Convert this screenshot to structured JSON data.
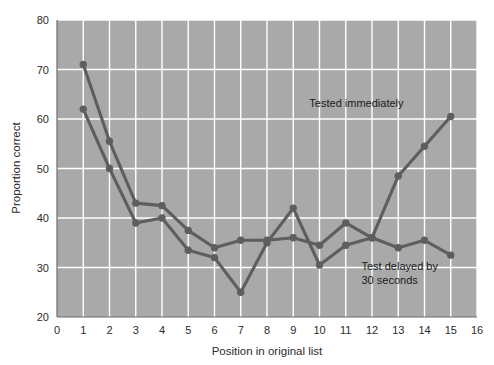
{
  "chart_data": {
    "type": "line",
    "title": "",
    "xlabel": "Position in original list",
    "ylabel": "Proportion correct",
    "xlim": [
      0,
      16
    ],
    "ylim": [
      20,
      80
    ],
    "xticks": [
      0,
      1,
      2,
      3,
      4,
      5,
      6,
      7,
      8,
      9,
      10,
      11,
      12,
      13,
      14,
      15,
      16
    ],
    "yticks": [
      20,
      30,
      40,
      50,
      60,
      70,
      80
    ],
    "grid": true,
    "legend_position": "inline-annotation",
    "x": [
      1,
      2,
      3,
      4,
      5,
      6,
      7,
      8,
      9,
      10,
      11,
      12,
      13,
      14,
      15
    ],
    "series": [
      {
        "name": "Tested immediately",
        "color": "#5e5e5e",
        "values": [
          71,
          55.5,
          43,
          42.5,
          37.5,
          34,
          35.5,
          35.5,
          36,
          34.5,
          39,
          36,
          48.5,
          54.5,
          60.5
        ],
        "annotation": "Tested immediately",
        "annotation_x": 13.2,
        "annotation_y": 62.5
      },
      {
        "name": "Test delayed by 30 seconds",
        "color": "#5e5e5e",
        "values": [
          62,
          50,
          39,
          40,
          33.5,
          32,
          25,
          35,
          42,
          30.5,
          34.5,
          36,
          34,
          35.5,
          32.5
        ],
        "annotation": "Test delayed by\n30 seconds",
        "annotation_line1": "Test delayed by",
        "annotation_line2": "30 seconds",
        "annotation_x": 11.6,
        "annotation_y": 29.5
      }
    ]
  },
  "labels": {
    "x_axis_title": "Position in original list",
    "y_axis_title": "Proportion correct",
    "series_1_annotation": "Tested immediately",
    "series_2_annotation_line1": "Test delayed by",
    "series_2_annotation_line2": "30 seconds"
  }
}
